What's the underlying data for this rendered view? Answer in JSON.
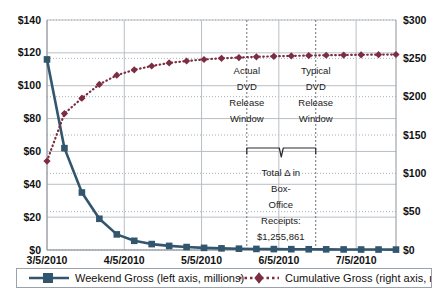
{
  "chart_data": {
    "type": "line",
    "title": "",
    "subtitle": "",
    "xlabel": "",
    "ylabel": "",
    "grid": true,
    "legend_position": "bottom",
    "x_tick_labels": [
      "3/5/2010",
      "4/5/2010",
      "5/5/2010",
      "6/5/2010",
      "7/5/2010"
    ],
    "x_tick_positions": [
      0,
      4.4286,
      8.8571,
      13.2857,
      17.7143
    ],
    "left_axis": {
      "label": "Weekend Gross (left axis, millions)",
      "ticks": [
        "$0",
        "$20",
        "$40",
        "$60",
        "$80",
        "$100",
        "$120",
        "$140"
      ],
      "tick_values": [
        0,
        20,
        40,
        60,
        80,
        100,
        120,
        140
      ],
      "ylim": [
        0,
        140
      ]
    },
    "right_axis": {
      "label": "Cumulative Gross (right axis, millions)",
      "ticks": [
        "$0",
        "$50",
        "$100",
        "$150",
        "$200",
        "$250",
        "$300"
      ],
      "tick_values": [
        0,
        50,
        100,
        150,
        200,
        250,
        300
      ],
      "ylim": [
        0,
        300
      ]
    },
    "x": [
      0,
      1,
      2,
      3,
      4,
      5,
      6,
      7,
      8,
      9,
      10,
      11,
      12,
      13,
      14,
      15,
      16,
      17,
      18,
      19,
      20
    ],
    "series": [
      {
        "name": "Weekend Gross (left axis, millions)",
        "axis": "left",
        "color": "#33566f",
        "marker": "square",
        "line_style": "solid",
        "values": [
          116.0,
          62.0,
          35.0,
          19.0,
          9.5,
          5.6,
          3.6,
          2.5,
          1.8,
          1.3,
          1.0,
          0.8,
          0.65,
          0.55,
          0.5,
          0.45,
          0.4,
          0.35,
          0.3,
          0.28,
          0.25
        ]
      },
      {
        "name": "Cumulative Gross (right axis, millions)",
        "axis": "right",
        "color": "#7c2d41",
        "marker": "diamond",
        "line_style": "dotted",
        "values": [
          116.0,
          178.0,
          198.0,
          216.0,
          228.0,
          235.0,
          240.0,
          244.0,
          246.5,
          248.5,
          250.0,
          251.0,
          252.0,
          252.6,
          253.2,
          253.6,
          254.0,
          254.3,
          254.6,
          254.8,
          255.0
        ]
      }
    ],
    "annotations": [
      {
        "name": "actual-dvd-release-window",
        "lines": [
          "Actual",
          "DVD",
          "Release",
          "Window"
        ],
        "x_index": 11.45
      },
      {
        "name": "typical-dvd-release-window",
        "lines": [
          "Typical",
          "DVD",
          "Release",
          "Window"
        ],
        "x_index": 15.4
      },
      {
        "name": "total-delta-box-office-receipts",
        "lines": [
          "Total Δ in",
          "Box-",
          "Office",
          "Receipts:",
          "$1,255,861"
        ],
        "x_index": 13.4
      }
    ],
    "vertical_markers": [
      {
        "name": "actual-dvd-release-line",
        "x_index": 11.45
      },
      {
        "name": "typical-dvd-release-line",
        "x_index": 15.4
      }
    ]
  },
  "legend": {
    "weekend_gross": "Weekend Gross (left axis, millions)",
    "cumulative_gross": "Cumulative Gross (right axis, millions)"
  },
  "colors": {
    "weekend_gross": "#33566f",
    "cumulative_gross": "#7c2d41",
    "gridline": "#b9bec4",
    "dotted_grid": "#a9b0b6",
    "text": "#111111",
    "legend_border": "#9aa3ab",
    "background": "#ffffff"
  }
}
